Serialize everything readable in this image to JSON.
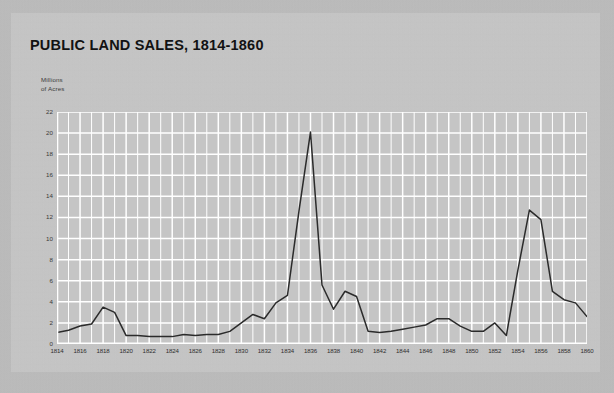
{
  "card": {
    "title": "PUBLIC LAND SALES, 1814-1860",
    "y_axis_caption": "Millions\nof Acres"
  },
  "colors": {
    "page_background": "#bdbdbd",
    "card_background": "#c6c6c6",
    "plot_background": "#c5c5c5",
    "gridline": "#ffffff",
    "series_line": "#2b2b2b",
    "axis_text": "#333333",
    "title_text": "#121212"
  },
  "chart_data": {
    "type": "line",
    "title": "PUBLIC LAND SALES, 1814-1860",
    "xlabel": "",
    "ylabel": "Millions of Acres",
    "xlim": [
      1814,
      1860
    ],
    "ylim": [
      0,
      22
    ],
    "yticks": [
      0,
      2,
      4,
      6,
      8,
      10,
      12,
      14,
      16,
      18,
      20,
      22
    ],
    "xticks": [
      1814,
      1816,
      1818,
      1820,
      1822,
      1824,
      1826,
      1828,
      1830,
      1832,
      1834,
      1836,
      1838,
      1840,
      1842,
      1844,
      1846,
      1848,
      1850,
      1852,
      1854,
      1856,
      1858,
      1860
    ],
    "grid": true,
    "grid_x_step": 1,
    "grid_y_step": 2,
    "legend": null,
    "series": [
      {
        "name": "Public land sales",
        "units": "millions of acres",
        "x": [
          1814,
          1815,
          1816,
          1817,
          1818,
          1819,
          1820,
          1821,
          1822,
          1823,
          1824,
          1825,
          1826,
          1827,
          1828,
          1829,
          1830,
          1831,
          1832,
          1833,
          1834,
          1835,
          1836,
          1837,
          1838,
          1839,
          1840,
          1841,
          1842,
          1843,
          1844,
          1845,
          1846,
          1847,
          1848,
          1849,
          1850,
          1851,
          1852,
          1853,
          1854,
          1855,
          1856,
          1857,
          1858,
          1859,
          1860
        ],
        "values": [
          1.1,
          1.3,
          1.7,
          1.9,
          3.5,
          3.0,
          0.8,
          0.8,
          0.7,
          0.7,
          0.7,
          0.9,
          0.8,
          0.9,
          0.9,
          1.2,
          2.0,
          2.8,
          2.4,
          3.9,
          4.6,
          12.6,
          20.1,
          5.6,
          3.3,
          5.0,
          4.5,
          1.2,
          1.1,
          1.2,
          1.4,
          1.6,
          1.8,
          2.4,
          2.4,
          1.7,
          1.2,
          1.2,
          2.0,
          0.8,
          7.0,
          12.7,
          11.8,
          5.0,
          4.2,
          3.9,
          2.6
        ]
      }
    ]
  }
}
